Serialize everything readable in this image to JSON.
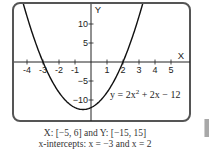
{
  "chart_data": {
    "type": "line",
    "title": "",
    "xlabel": "X",
    "ylabel": "Y",
    "xlim": [
      -5,
      6
    ],
    "ylim": [
      -15,
      15
    ],
    "x_ticks": [
      -4,
      -3,
      -2,
      -1,
      1,
      2,
      3,
      4,
      5
    ],
    "x_tick_labels": [
      "-4",
      "-3",
      "-2",
      "-1",
      "1",
      "2",
      "3",
      "4",
      "5"
    ],
    "y_ticks": [
      10,
      5,
      -5,
      -10
    ],
    "y_tick_labels": [
      "10",
      "5",
      "−5",
      "−10"
    ],
    "grid": false,
    "series": [
      {
        "name": "y = 2x^2 + 2x - 12",
        "function": {
          "a": 2,
          "b": 2,
          "c": -12
        },
        "x": [
          -5,
          -4,
          -3,
          -2,
          -1,
          -0.5,
          0,
          1,
          2,
          3,
          4
        ],
        "y": [
          28,
          12,
          0,
          -8,
          -12,
          -12.5,
          -12,
          -8,
          0,
          12,
          28
        ]
      }
    ],
    "annotations": [
      {
        "text_parts": [
          "y = 2x",
          "2",
          " + 2x − 12"
        ],
        "position": "lower-right"
      }
    ]
  },
  "caption": {
    "line1": "X: [−5, 6] and Y: [−15, 15]",
    "line2": "x-intercepts: x = −3 and x = 2"
  }
}
